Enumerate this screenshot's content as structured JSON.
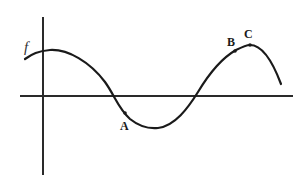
{
  "diagram": {
    "title": "",
    "function_label": "f",
    "points": [
      {
        "label": "A",
        "description": "point on descending segment below x-axis"
      },
      {
        "label": "B",
        "description": "point on ascending segment just before maximum"
      },
      {
        "label": "C",
        "description": "local maximum"
      }
    ],
    "colors": {
      "line": "#1a1a1a",
      "axis": "#2a2a2a",
      "background": "#ffffff"
    }
  }
}
